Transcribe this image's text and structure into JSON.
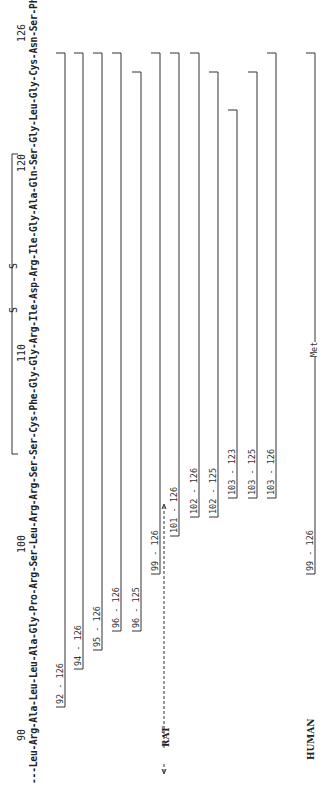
{
  "sequence": {
    "text": "---Leu-Arg-Ala-Leu-Leu-Ala-Gly-Pro-Arg-Ser-Leu-Arg-Arg-Ser-Ser-Cys-Phe-Gly-Gly-Arg-Ile-Asp-Arg-Ile-Gly-Ala-Gln-Ser-Gly-Leu-Gly-Cys-Asn-Ser-Phe-Arg-Tyr-COOH",
    "position_labels": [
      "90",
      "100",
      "110",
      "120",
      "126"
    ],
    "disulfide_label_left": "S",
    "disulfide_label_right": "S"
  },
  "groups": {
    "rat_label": "RAT",
    "human_label": "HUMAN"
  },
  "fragments": {
    "rat": [
      {
        "label": "92 - 126",
        "start": 92,
        "end": 126
      },
      {
        "label": "94 - 126",
        "start": 94,
        "end": 126
      },
      {
        "label": "95 - 126",
        "start": 95,
        "end": 126
      },
      {
        "label": "96 - 126",
        "start": 96,
        "end": 126
      },
      {
        "label": "96 - 125",
        "start": 96,
        "end": 125
      },
      {
        "label": "99 - 126",
        "start": 99,
        "end": 126
      },
      {
        "label": "101 - 126",
        "start": 101,
        "end": 126
      },
      {
        "label": "102 - 126",
        "start": 102,
        "end": 126
      },
      {
        "label": "102 - 125",
        "start": 102,
        "end": 125
      },
      {
        "label": "103 - 123",
        "start": 103,
        "end": 123
      },
      {
        "label": "103 - 125",
        "start": 103,
        "end": 125
      },
      {
        "label": "103 - 126",
        "start": 103,
        "end": 126
      }
    ],
    "human": [
      {
        "label": "99 - 126",
        "start": 99,
        "end": 126,
        "annotation": "Met"
      }
    ]
  }
}
